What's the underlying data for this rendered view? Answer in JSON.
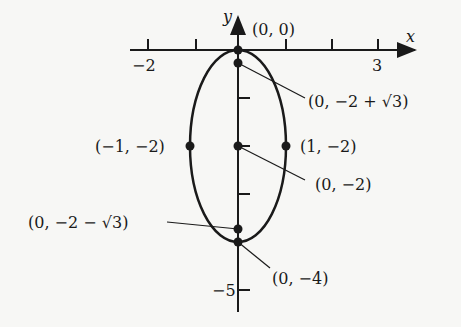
{
  "axes": {
    "x_label": "x",
    "y_label": "y",
    "x_ticks": [
      {
        "value": -2,
        "label": "−2"
      },
      {
        "value": -1,
        "label": ""
      },
      {
        "value": 1,
        "label": ""
      },
      {
        "value": 2,
        "label": ""
      },
      {
        "value": 3,
        "label": "3"
      }
    ],
    "y_ticks": [
      {
        "value": -1,
        "label": ""
      },
      {
        "value": -2,
        "label": ""
      },
      {
        "value": -3,
        "label": ""
      },
      {
        "value": -5,
        "label": "−5"
      }
    ]
  },
  "ellipse": {
    "center": [
      0,
      -2
    ],
    "semi_x": 1,
    "semi_y": 2
  },
  "points": {
    "origin": "(0, 0)",
    "upper_focus": "(0, −2 + √3)",
    "left_vertex": "(−1, −2)",
    "right_vertex": "(1, −2)",
    "center": "(0, −2)",
    "lower_focus": "(0, −2 − √3)",
    "bottom_vertex": "(0, −4)"
  },
  "colors": {
    "ink": "#1a1a1a",
    "background": "#f7f7f5"
  }
}
